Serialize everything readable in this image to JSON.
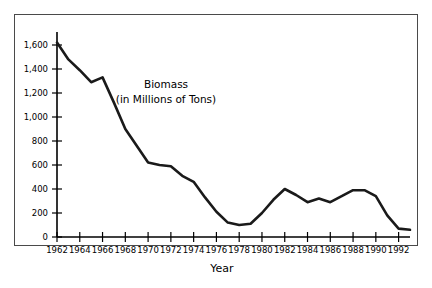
{
  "chart_data": {
    "type": "line",
    "title": "",
    "annotation_lines": [
      "Biomass",
      "(in Millions of Tons)"
    ],
    "xlabel": "Year",
    "ylabel": "",
    "xlim": [
      1962,
      1993
    ],
    "ylim": [
      0,
      1700
    ],
    "grid": false,
    "legend": "none",
    "y_ticks": [
      0,
      200,
      400,
      600,
      800,
      1000,
      1200,
      1400,
      1600
    ],
    "y_tick_labels": [
      "0",
      "200",
      "400",
      "600",
      "800",
      "1,000",
      "1,200",
      "1,400",
      "1,600"
    ],
    "x_ticks": [
      1962,
      1964,
      1966,
      1968,
      1970,
      1972,
      1974,
      1976,
      1978,
      1980,
      1982,
      1984,
      1986,
      1988,
      1990,
      1992
    ],
    "x_tick_labels": [
      "1962",
      "1964",
      "1966",
      "1968",
      "1970",
      "1972",
      "1974",
      "1976",
      "1978",
      "1980",
      "1982",
      "1984",
      "1986",
      "1988",
      "1990",
      "1992"
    ],
    "x": [
      1962,
      1963,
      1964,
      1965,
      1966,
      1967,
      1968,
      1969,
      1970,
      1971,
      1972,
      1973,
      1974,
      1975,
      1976,
      1977,
      1978,
      1979,
      1980,
      1981,
      1982,
      1983,
      1984,
      1985,
      1986,
      1987,
      1988,
      1989,
      1990,
      1991,
      1992,
      1993
    ],
    "values": [
      1620,
      1480,
      1390,
      1290,
      1330,
      1120,
      900,
      760,
      620,
      600,
      590,
      510,
      460,
      330,
      210,
      120,
      100,
      110,
      200,
      310,
      400,
      350,
      290,
      320,
      290,
      340,
      390,
      390,
      340,
      180,
      70,
      60
    ],
    "series": [
      {
        "name": "Biomass",
        "units": "Millions of Tons",
        "color": "#1a1a1a",
        "values": [
          1620,
          1480,
          1390,
          1290,
          1330,
          1120,
          900,
          760,
          620,
          600,
          590,
          510,
          460,
          330,
          210,
          120,
          100,
          110,
          200,
          310,
          400,
          350,
          290,
          320,
          290,
          340,
          390,
          390,
          340,
          180,
          70,
          60
        ]
      }
    ]
  }
}
